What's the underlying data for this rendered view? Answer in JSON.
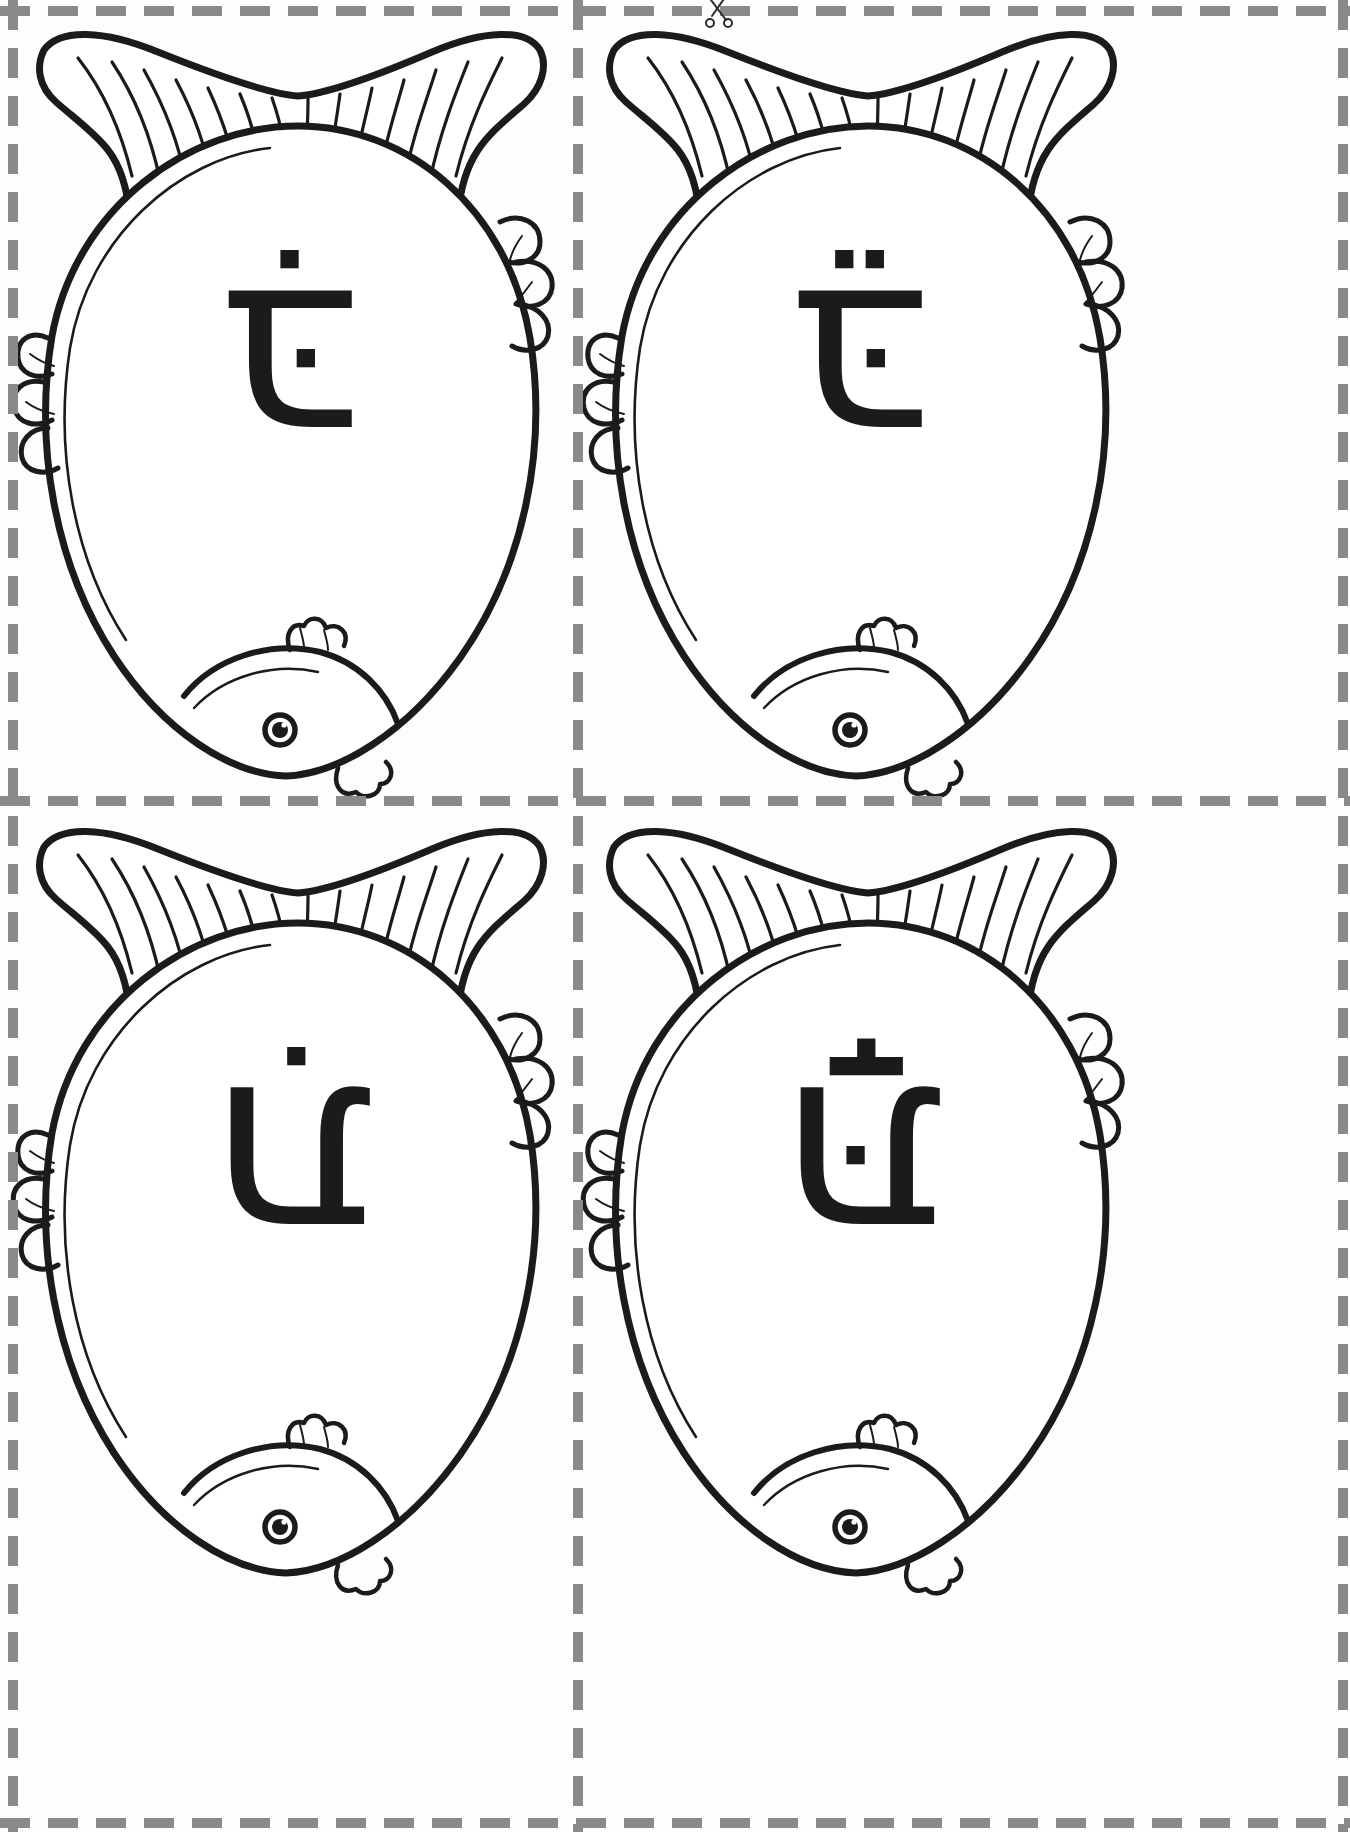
{
  "page": {
    "background_color": "#fdfdfd",
    "ink_color": "#1b1b1b",
    "cut_line_color": "#8a8a8a",
    "columns": 2,
    "rows": 2
  },
  "cut_lines": {
    "horizontal_label": "horizontal-cut-line",
    "vertical_label": "vertical-cut-line",
    "style": "dashed"
  },
  "scissors": {
    "icon_name": "scissors-icon",
    "label": "cut here"
  },
  "cards": [
    {
      "id": "card-top-left",
      "position": "top-left",
      "letter": "בִּ",
      "letter_name": "bet",
      "vowel_name": "hiriq",
      "orientation_degrees": 180,
      "art_name": "fish-outline"
    },
    {
      "id": "card-top-right",
      "position": "top-right",
      "letter": "בֵּ",
      "letter_name": "bet",
      "vowel_name": "tsere",
      "orientation_degrees": 180,
      "art_name": "fish-outline"
    },
    {
      "id": "card-bottom-left",
      "position": "bottom-left",
      "letter": "תִ",
      "letter_name": "tav",
      "vowel_name": "hiriq",
      "orientation_degrees": 180,
      "art_name": "fish-outline"
    },
    {
      "id": "card-bottom-right",
      "position": "bottom-right",
      "letter": "תָּ",
      "letter_name": "tav",
      "vowel_name": "qamats",
      "orientation_degrees": 180,
      "art_name": "fish-outline"
    }
  ]
}
